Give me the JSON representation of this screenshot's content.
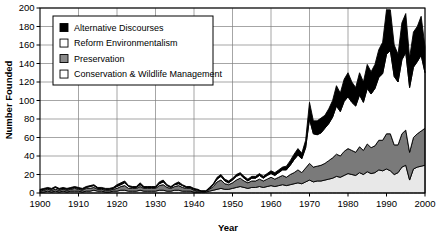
{
  "chart_data": {
    "type": "area",
    "stacked": true,
    "title": "",
    "xlabel": "Year",
    "ylabel": "Number Founded",
    "xlim": [
      1900,
      2000
    ],
    "ylim": [
      0,
      200
    ],
    "ytick_step": 20,
    "xtick_step": 10,
    "grid": true,
    "legend_position": "top-left",
    "xticks": [
      1900,
      1910,
      1920,
      1930,
      1940,
      1950,
      1960,
      1970,
      1980,
      1990,
      2000
    ],
    "yticks": [
      0,
      20,
      40,
      60,
      80,
      100,
      120,
      140,
      160,
      180,
      200
    ],
    "x": [
      1900,
      1901,
      1902,
      1903,
      1904,
      1905,
      1906,
      1907,
      1908,
      1909,
      1910,
      1911,
      1912,
      1913,
      1914,
      1915,
      1916,
      1917,
      1918,
      1919,
      1920,
      1921,
      1922,
      1923,
      1924,
      1925,
      1926,
      1927,
      1928,
      1929,
      1930,
      1931,
      1932,
      1933,
      1934,
      1935,
      1936,
      1937,
      1938,
      1939,
      1940,
      1941,
      1942,
      1943,
      1944,
      1945,
      1946,
      1947,
      1948,
      1949,
      1950,
      1951,
      1952,
      1953,
      1954,
      1955,
      1956,
      1957,
      1958,
      1959,
      1960,
      1961,
      1962,
      1963,
      1964,
      1965,
      1966,
      1967,
      1968,
      1969,
      1970,
      1971,
      1972,
      1973,
      1974,
      1975,
      1976,
      1977,
      1978,
      1979,
      1980,
      1981,
      1982,
      1983,
      1984,
      1985,
      1986,
      1987,
      1988,
      1989,
      1990,
      1991,
      1992,
      1993,
      1994,
      1995,
      1996,
      1997,
      1998,
      1999,
      2000
    ],
    "series": [
      {
        "name": "Conservation & Wildlife Management",
        "order": 1,
        "color": "#e8e8e8",
        "legend_swatch": "white",
        "values": [
          1,
          1,
          2,
          1,
          2,
          1,
          2,
          1,
          2,
          2,
          2,
          1,
          2,
          2,
          3,
          2,
          2,
          1,
          1,
          2,
          2,
          3,
          3,
          2,
          2,
          2,
          3,
          2,
          2,
          2,
          2,
          3,
          3,
          2,
          2,
          3,
          3,
          2,
          2,
          2,
          1,
          1,
          1,
          1,
          2,
          3,
          4,
          5,
          4,
          4,
          5,
          6,
          7,
          6,
          5,
          6,
          6,
          7,
          6,
          7,
          8,
          7,
          8,
          9,
          8,
          9,
          10,
          11,
          10,
          12,
          14,
          12,
          13,
          13,
          14,
          15,
          16,
          18,
          17,
          19,
          21,
          20,
          19,
          22,
          20,
          23,
          21,
          22,
          25,
          24,
          26,
          24,
          20,
          22,
          28,
          30,
          14,
          26,
          28,
          29,
          30
        ]
      },
      {
        "name": "Preservation",
        "order": 2,
        "color": "#7a7a7a",
        "legend_swatch": "gray",
        "values": [
          1,
          2,
          2,
          2,
          2,
          2,
          2,
          2,
          2,
          3,
          2,
          2,
          3,
          3,
          3,
          2,
          2,
          2,
          2,
          2,
          3,
          4,
          5,
          3,
          3,
          3,
          4,
          3,
          3,
          3,
          3,
          5,
          6,
          4,
          3,
          4,
          5,
          4,
          3,
          3,
          2,
          1,
          1,
          1,
          2,
          4,
          8,
          9,
          6,
          5,
          6,
          8,
          9,
          7,
          6,
          7,
          7,
          8,
          7,
          8,
          9,
          8,
          9,
          10,
          9,
          11,
          12,
          14,
          12,
          15,
          18,
          16,
          16,
          17,
          18,
          20,
          22,
          24,
          23,
          26,
          27,
          26,
          25,
          28,
          26,
          30,
          28,
          29,
          32,
          33,
          38,
          40,
          32,
          30,
          36,
          38,
          30,
          34,
          36,
          38,
          40
        ]
      },
      {
        "name": "Reform Environmentalism",
        "order": 3,
        "color": "#ffffff",
        "legend_swatch": "white",
        "values": [
          1,
          1,
          1,
          1,
          2,
          1,
          1,
          1,
          1,
          1,
          1,
          1,
          1,
          2,
          2,
          1,
          1,
          1,
          1,
          1,
          2,
          2,
          3,
          2,
          1,
          1,
          2,
          1,
          1,
          1,
          1,
          2,
          3,
          2,
          1,
          2,
          2,
          2,
          1,
          1,
          1,
          1,
          0,
          0,
          1,
          2,
          3,
          4,
          3,
          2,
          3,
          4,
          4,
          3,
          2,
          3,
          3,
          4,
          3,
          4,
          4,
          4,
          5,
          6,
          8,
          10,
          14,
          16,
          15,
          22,
          48,
          36,
          34,
          35,
          38,
          40,
          44,
          52,
          48,
          54,
          56,
          52,
          50,
          56,
          52,
          60,
          58,
          62,
          68,
          72,
          86,
          90,
          74,
          68,
          80,
          84,
          70,
          76,
          78,
          82,
          60
        ]
      },
      {
        "name": "Alternative Discourses",
        "order": 4,
        "color": "#000000",
        "legend_swatch": "black",
        "values": [
          1,
          1,
          1,
          1,
          1,
          1,
          1,
          1,
          1,
          1,
          1,
          1,
          1,
          1,
          1,
          1,
          1,
          1,
          1,
          1,
          2,
          2,
          2,
          1,
          1,
          1,
          2,
          1,
          1,
          1,
          1,
          2,
          2,
          1,
          1,
          1,
          2,
          1,
          1,
          1,
          1,
          1,
          0,
          0,
          1,
          1,
          2,
          2,
          2,
          2,
          2,
          2,
          2,
          2,
          2,
          2,
          2,
          2,
          2,
          2,
          3,
          3,
          3,
          3,
          4,
          5,
          6,
          7,
          6,
          8,
          18,
          14,
          15,
          16,
          14,
          16,
          18,
          22,
          20,
          24,
          26,
          22,
          20,
          24,
          22,
          26,
          24,
          26,
          30,
          34,
          48,
          44,
          34,
          30,
          40,
          42,
          32,
          38,
          38,
          42,
          28
        ]
      }
    ],
    "annotations": {
      "peak_year": 1990,
      "peak_total": 198,
      "takeoff_year": 1970
    }
  },
  "legend": {
    "entries": [
      {
        "label": "Alternative Discourses",
        "swatch": "black"
      },
      {
        "label": "Reform Environmentalism",
        "swatch": "white"
      },
      {
        "label": "Preservation",
        "swatch": "gray"
      },
      {
        "label": "Conservation & Wildlife Management",
        "swatch": "white"
      }
    ]
  },
  "colors": {
    "alternative_discourses": "#000000",
    "reform_environmentalism": "#ffffff",
    "preservation": "#7a7a7a",
    "conservation": "#e8e8e8",
    "grid": "#808080",
    "axis": "#000000"
  }
}
